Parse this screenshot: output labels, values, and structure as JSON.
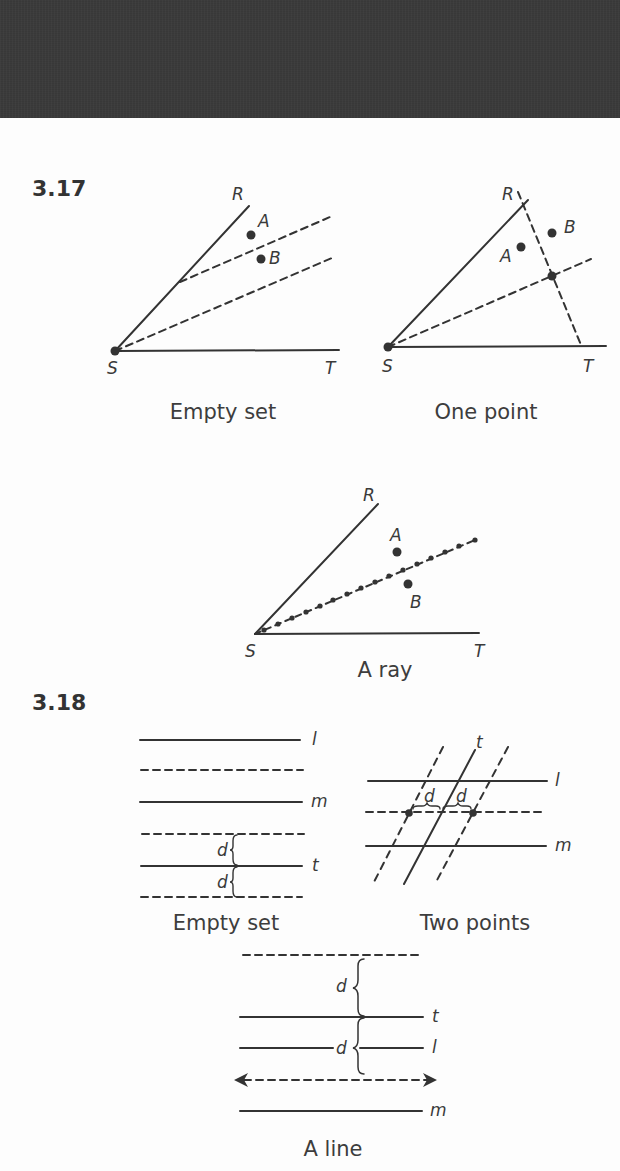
{
  "problems": [
    {
      "number": "3.17",
      "figures": [
        {
          "caption": "Empty set",
          "labels": {
            "R": "R",
            "S": "S",
            "T": "T",
            "A": "A",
            "B": "B"
          }
        },
        {
          "caption": "One point",
          "labels": {
            "R": "R",
            "S": "S",
            "T": "T",
            "A": "A",
            "B": "B"
          }
        },
        {
          "caption": "A ray",
          "labels": {
            "R": "R",
            "S": "S",
            "T": "T",
            "A": "A",
            "B": "B"
          }
        }
      ]
    },
    {
      "number": "3.18",
      "figures": [
        {
          "caption": "Empty set",
          "labels": {
            "l": "l",
            "m": "m",
            "t": "t",
            "d1": "d",
            "d2": "d"
          }
        },
        {
          "caption": "Two points",
          "labels": {
            "l": "l",
            "m": "m",
            "t": "t",
            "d1": "d",
            "d2": "d"
          }
        },
        {
          "caption": "A line",
          "labels": {
            "l": "l",
            "m": "m",
            "t": "t",
            "d1": "d",
            "d2": "d"
          }
        }
      ]
    }
  ],
  "colors": {
    "top_band": "#3b3b3b",
    "ink": "#333333",
    "page": "#fdfdfd"
  }
}
